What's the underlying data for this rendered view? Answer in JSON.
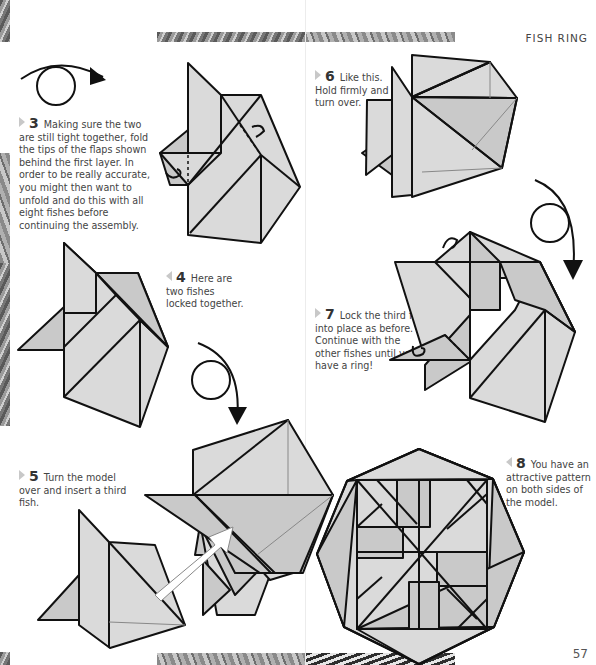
{
  "header": {
    "title": "FISH RING"
  },
  "page_number": "57",
  "steps": [
    {
      "number": "3",
      "marker": "right",
      "text": "Making sure the two are still tight together, fold the tips of the flaps shown behind the first layer. In order to be really accurate, you might then want to unfold and do this with all eight fishes before continuing the assembly."
    },
    {
      "number": "4",
      "marker": "left",
      "text": "Here are two fishes locked together."
    },
    {
      "number": "5",
      "marker": "right",
      "text": "Turn the model over and insert a third fish."
    },
    {
      "number": "6",
      "marker": "right",
      "text": "Like this. Hold firmly and turn over."
    },
    {
      "number": "7",
      "marker": "right",
      "text": "Lock the third fish into place as before. Continue with the other fishes until you have a ring!"
    },
    {
      "number": "8",
      "marker": "left",
      "text": "You have an attractive pattern on both sides of the model."
    }
  ],
  "icons": {
    "turn_over_arrow": "turn-over-icon",
    "insert_arrow": "insert-arrow-icon"
  },
  "colors": {
    "paper_fill": "#dadada",
    "paper_dark": "#c9c9c9",
    "outline": "#111111",
    "text": "#444444"
  }
}
